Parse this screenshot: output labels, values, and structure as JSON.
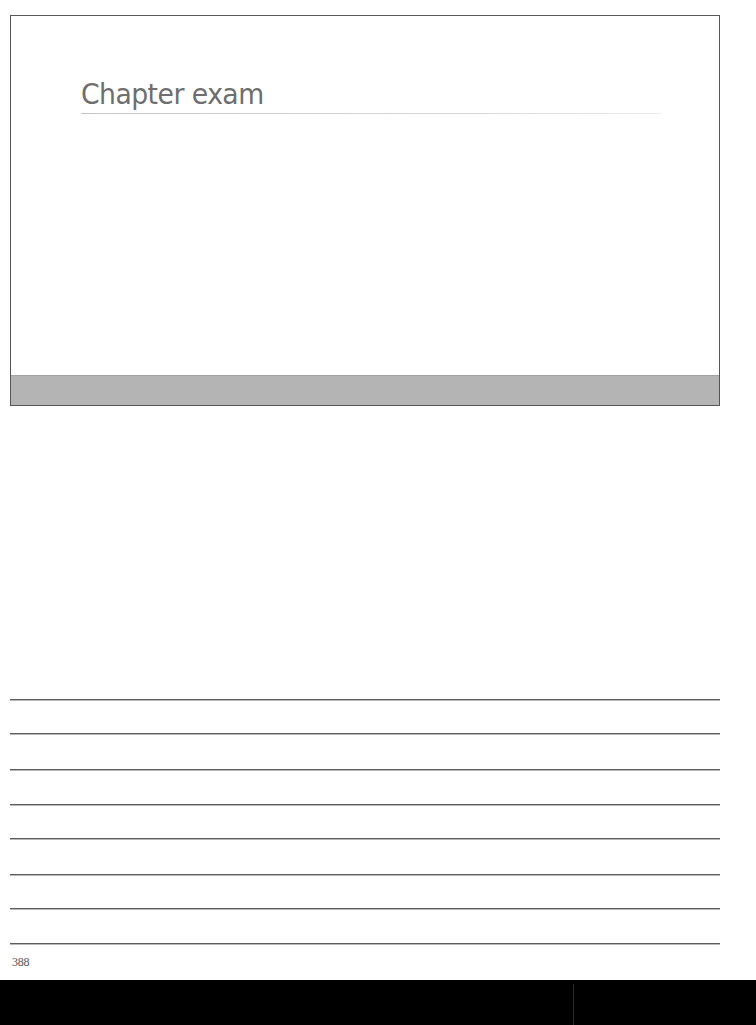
{
  "slide": {
    "title": "Chapter exam",
    "footer_bar_color": "#b4b4b4",
    "title_color": "#6e6e6e"
  },
  "notes": {
    "line_count": 8,
    "line_positions_y": [
      700,
      734,
      770,
      805,
      839,
      875,
      909,
      944
    ]
  },
  "page": {
    "number": "388"
  }
}
